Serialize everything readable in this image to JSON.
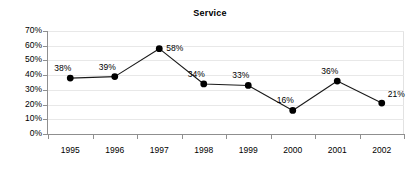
{
  "chart_data": {
    "type": "line",
    "title": "Service",
    "xlabel": "",
    "ylabel": "",
    "categories": [
      "1995",
      "1996",
      "1997",
      "1998",
      "1999",
      "2000",
      "2001",
      "2002"
    ],
    "values": [
      38,
      39,
      58,
      34,
      33,
      16,
      36,
      21
    ],
    "point_labels": [
      "38%",
      "39%",
      "58%",
      "34%",
      "33%",
      "16%",
      "36%",
      "21%"
    ],
    "ylim": [
      0,
      70
    ],
    "y_ticks": [
      0,
      10,
      20,
      30,
      40,
      50,
      60,
      70
    ],
    "y_tick_labels": [
      "0%",
      "10%",
      "20%",
      "30%",
      "40%",
      "50%",
      "60%",
      "70%"
    ],
    "grid": "horizontal",
    "legend": "none",
    "series": [
      {
        "name": "Service",
        "values": [
          38,
          39,
          58,
          34,
          33,
          16,
          36,
          21
        ]
      }
    ],
    "colors": {
      "line": "#1a1a1a",
      "marker": "#000000",
      "grid": "#e8e8e8",
      "axis": "#8f8f8f",
      "text": "#000000",
      "background": "#ffffff"
    },
    "label_offsets": [
      {
        "dx": -16,
        "dy": -14
      },
      {
        "dx": -16,
        "dy": -14
      },
      {
        "dx": 7,
        "dy": -5
      },
      {
        "dx": -16,
        "dy": -14
      },
      {
        "dx": -16,
        "dy": -14
      },
      {
        "dx": -16,
        "dy": -14
      },
      {
        "dx": -16,
        "dy": -14
      },
      {
        "dx": 6,
        "dy": -13
      }
    ]
  }
}
